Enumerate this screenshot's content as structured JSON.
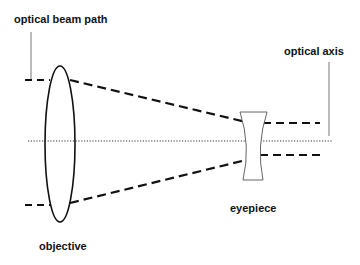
{
  "diagram": {
    "type": "optical-schematic",
    "labels": {
      "beam_path": "optical beam path",
      "axis": "optical axis",
      "objective": "objective",
      "eyepiece": "eyepiece"
    },
    "colors": {
      "background": "#ffffff",
      "stroke": "#111111",
      "leader_line": "#777777",
      "eyepiece_outline": "#666666"
    },
    "components": [
      {
        "name": "objective",
        "kind": "convex lens (ellipse)"
      },
      {
        "name": "eyepiece",
        "kind": "concave lens"
      }
    ]
  }
}
